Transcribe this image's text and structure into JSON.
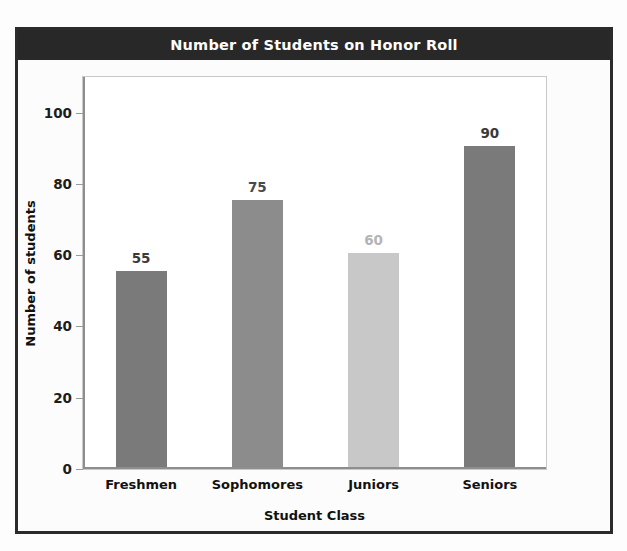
{
  "chart_data": {
    "type": "bar",
    "title": "Number of Students on Honor Roll",
    "xlabel": "Student Class",
    "ylabel": "Number of students",
    "categories": [
      "Freshmen",
      "Sophomores",
      "Juniors",
      "Seniors"
    ],
    "values": [
      55,
      75,
      60,
      90
    ],
    "value_labels": [
      "55",
      "75",
      "60",
      "90"
    ],
    "bar_colors": [
      "#7a7a7a",
      "#8c8c8c",
      "#c8c8c8",
      "#7a7a7a"
    ],
    "label_colors": [
      "#3a3a3a",
      "#4a4a4a",
      "#b5b5b5",
      "#3a3a3a"
    ],
    "ylim": [
      0,
      110
    ],
    "yticks": [
      0,
      20,
      40,
      60,
      80,
      100
    ],
    "ytick_labels": [
      "0",
      "20",
      "40",
      "60",
      "80",
      "100"
    ],
    "grid": false,
    "legend": "none"
  },
  "figure": {
    "title_band_color": "#282828",
    "title_text_color": "#ffffff",
    "frame_color": "#2b2b2b",
    "plot_background": "#ffffff",
    "axis_color": "#8e8e8e"
  }
}
